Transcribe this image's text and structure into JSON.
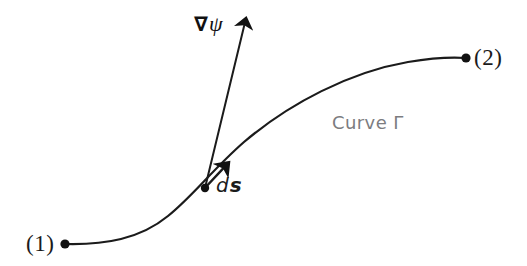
{
  "figure": {
    "kind": "line-diagram",
    "background_color": "#ffffff",
    "width": 527,
    "height": 266,
    "stroke_color": "#1b1b1b",
    "annotation_color": "#7c7c80"
  },
  "labels": {
    "point_1": "(1)",
    "point_2": "(2)",
    "curve_name": "Curve Γ",
    "gradient_nabla": "∇",
    "gradient_field": "ψ",
    "differential_d": "d",
    "differential_s": "s"
  },
  "chart_data": {
    "type": "line",
    "title": "",
    "xlabel": "",
    "ylabel": "",
    "grid": false,
    "legend": "none",
    "axis_visible": false,
    "xlim": [
      0,
      527
    ],
    "ylim": [
      266,
      0
    ],
    "series": [
      {
        "name": "Curve Γ",
        "kind": "open-curve",
        "stroke": "#1b1b1b",
        "stroke_width": 2.2,
        "path": "M 65 244 C 105 245 140 239 168 216 C 193 196 212 170 244 142 C 290 103 350 72 408 62 C 432 58 452 57 466 58",
        "points": [
          {
            "x": 65,
            "y": 244,
            "label": "(1)",
            "marker": "filled-dot"
          },
          {
            "x": 205,
            "y": 188,
            "label": "",
            "marker": "filled-dot"
          },
          {
            "x": 466,
            "y": 58,
            "label": "(2)",
            "marker": "filled-dot"
          }
        ]
      }
    ],
    "vectors": [
      {
        "name": "∇ψ",
        "kind": "arrow",
        "from": {
          "x": 205,
          "y": 188
        },
        "to": {
          "x": 247,
          "y": 14
        },
        "stroke": "#1b1b1b",
        "stroke_width": 2.0,
        "head": "solid",
        "label": "∇ψ",
        "label_position": {
          "x": 194,
          "y": 13
        }
      },
      {
        "name": "ds",
        "kind": "arrow",
        "from": {
          "x": 203,
          "y": 190
        },
        "to": {
          "x": 231,
          "y": 160
        },
        "stroke": "#1b1b1b",
        "stroke_width": 2.4,
        "head": "solid",
        "label": "ds",
        "label_position": {
          "x": 216,
          "y": 175
        }
      }
    ],
    "markers": [
      {
        "name": "endpoint-1",
        "x": 65,
        "y": 244,
        "radius": 4.6,
        "fill": "#111111"
      },
      {
        "name": "endpoint-2",
        "x": 466,
        "y": 58,
        "radius": 4.6,
        "fill": "#111111"
      },
      {
        "name": "tangent-point",
        "x": 205,
        "y": 188,
        "radius": 4.2,
        "fill": "#111111"
      }
    ],
    "annotations": [
      {
        "text": "Curve Γ",
        "x": 332,
        "y": 114,
        "color": "#7c7c80"
      },
      {
        "text": "(1)",
        "x": 26,
        "y": 232,
        "color": "#1b1b1b"
      },
      {
        "text": "(2)",
        "x": 474,
        "y": 46,
        "color": "#1b1b1b"
      },
      {
        "text": "∇ψ",
        "x": 194,
        "y": 13,
        "color": "#111111"
      },
      {
        "text": "ds",
        "x": 216,
        "y": 175,
        "color": "#1b1b1b"
      }
    ]
  }
}
